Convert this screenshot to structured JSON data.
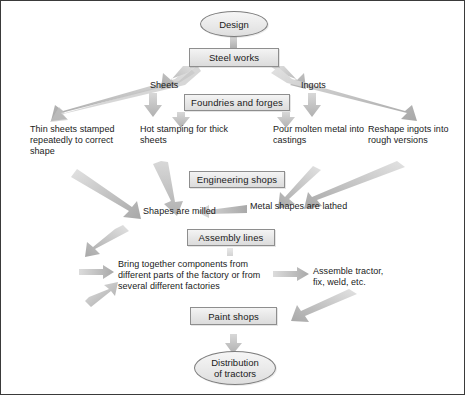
{
  "diagram": {
    "colors": {
      "arrow_fill": "#c9c9c9",
      "arrow_fill_dark": "#9e9e9e",
      "box_border": "#8e8e8e",
      "frame_border": "#3a3a3a",
      "text": "#1a1a1a"
    },
    "nodes": [
      {
        "id": "design",
        "shape": "ellipse",
        "label": "Design"
      },
      {
        "id": "steel-works",
        "shape": "box",
        "label": "Steel works"
      },
      {
        "id": "foundries",
        "shape": "box",
        "label": "Foundries and forges"
      },
      {
        "id": "engineering-shops",
        "shape": "box",
        "label": "Engineering shops"
      },
      {
        "id": "assembly-lines",
        "shape": "box",
        "label": "Assembly lines"
      },
      {
        "id": "paint-shops",
        "shape": "box",
        "label": "Paint shops"
      },
      {
        "id": "distribution",
        "shape": "ellipse",
        "label": "Distribution\nof tractors",
        "line1": "Distribution",
        "line2": "of tractors"
      }
    ],
    "labels": [
      {
        "id": "sheets",
        "text": "Sheets"
      },
      {
        "id": "ingots",
        "text": "Ingots"
      },
      {
        "id": "thin-sheets",
        "line1": "Thin sheets stamped",
        "line2": "repeatedly to correct",
        "line3": "shape"
      },
      {
        "id": "hot-stamping",
        "line1": "Hot stamping for thick",
        "line2": "sheets"
      },
      {
        "id": "pour-molten",
        "line1": "Pour molten metal into",
        "line2": "castings"
      },
      {
        "id": "reshape-ingots",
        "line1": "Reshape ingots into",
        "line2": "rough versions"
      },
      {
        "id": "metal-lathed",
        "line1": "Metal shapes are lathed"
      },
      {
        "id": "shapes-milled",
        "line1": "Shapes are milled"
      },
      {
        "id": "bring-together",
        "line1": "Bring together components from",
        "line2": "different parts of the factory or from",
        "line3": "several different factories"
      },
      {
        "id": "assemble-tractor",
        "line1": "Assemble tractor,",
        "line2": "fix, weld, etc."
      }
    ]
  }
}
